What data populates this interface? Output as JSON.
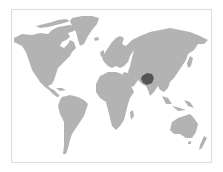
{
  "map": {
    "type": "world-locator-map",
    "highlighted_region": "Afghanistan",
    "colors": {
      "background": "#ffffff",
      "frame": "#dcdcdc",
      "land": "#b3b3b3",
      "highlight": "#555555"
    }
  }
}
